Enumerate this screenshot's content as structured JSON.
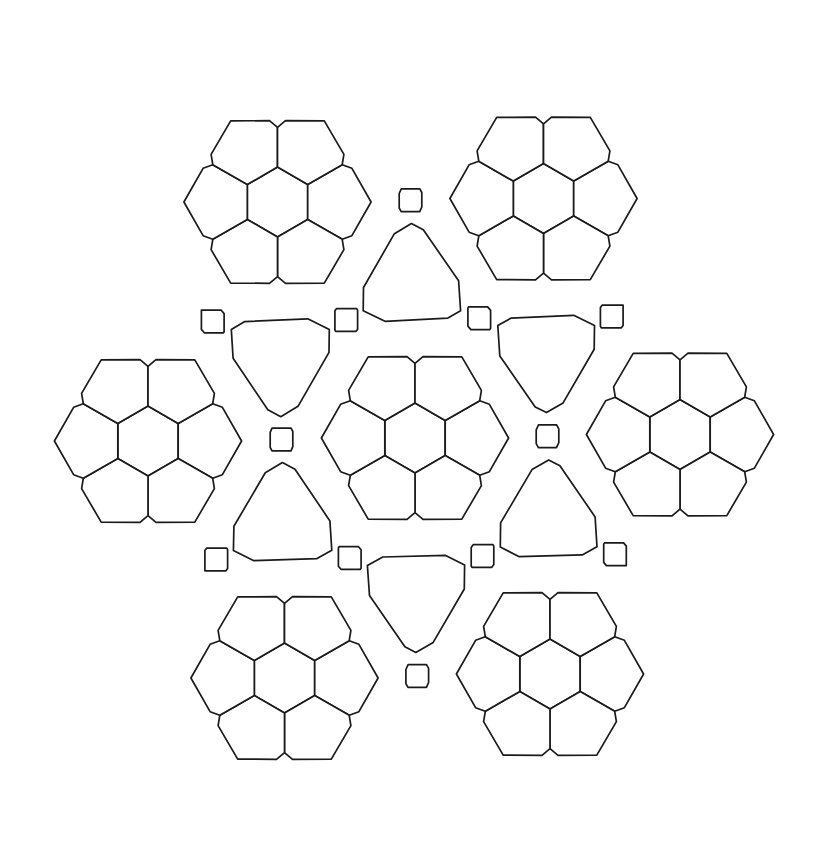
{
  "figure": {
    "line_color": "#1a1a1a",
    "fill_color": "#ffffff",
    "background": "#ffffff"
  },
  "tile_types": [
    {
      "name": "hexagon",
      "sides": 6
    },
    {
      "name": "heptagon",
      "sides": 7
    },
    {
      "name": "pentagon",
      "sides": 5
    },
    {
      "name": "decagon",
      "sides": 10
    },
    {
      "name": "square",
      "sides": 4
    }
  ],
  "clusters": [
    {
      "id": "center"
    },
    {
      "id": "top-left"
    },
    {
      "id": "top-right"
    },
    {
      "id": "left"
    },
    {
      "id": "right"
    },
    {
      "id": "bottom-left"
    },
    {
      "id": "bottom-right"
    }
  ]
}
